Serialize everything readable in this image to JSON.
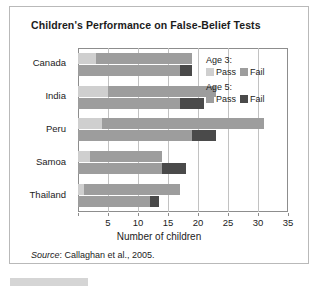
{
  "figure": {
    "title": "Children's Performance on False-Belief Tests",
    "source_word": "Source",
    "source_rest": ": Callaghan et al., 2005."
  },
  "legend": {
    "groups": [
      {
        "heading": "Age 3:",
        "items": [
          {
            "label": "Pass",
            "color": "#cfcfcf"
          },
          {
            "label": "Fail",
            "color": "#9d9d9d"
          }
        ]
      },
      {
        "heading": "Age 5:",
        "items": [
          {
            "label": "Pass",
            "color": "#9d9d9d"
          },
          {
            "label": "Fail",
            "color": "#4a4a4a"
          }
        ]
      }
    ]
  },
  "colors": {
    "age3_pass": "#cfcfcf",
    "age3_fail": "#9d9d9d",
    "age5_pass": "#9d9d9d",
    "age5_fail": "#4a4a4a",
    "gridline": "#c2c2c2",
    "axis": "#8d8d8d",
    "border": "#b9b9b9",
    "text": "#1c1c1c"
  },
  "chart_data": {
    "type": "bar",
    "orientation": "horizontal",
    "grouped": true,
    "stacked": true,
    "title": "Children's Performance on False-Belief Tests",
    "xlabel": "Number of children",
    "ylabel": "",
    "xlim": [
      0,
      35
    ],
    "xticks": [
      0,
      5,
      10,
      15,
      20,
      25,
      30,
      35
    ],
    "xtick_labels": [
      "",
      "5",
      "10",
      "15",
      "20",
      "25",
      "30",
      "35"
    ],
    "grid": "vertical",
    "legend_position": "upper right (inside plot)",
    "categories": [
      "Canada",
      "India",
      "Peru",
      "Samoa",
      "Thailand"
    ],
    "series": [
      {
        "name": "Age 3: Pass",
        "color": "#cfcfcf",
        "values": [
          3,
          5,
          4,
          2,
          1
        ]
      },
      {
        "name": "Age 3: Fail",
        "color": "#9d9d9d",
        "values": [
          16,
          18,
          27,
          12,
          16
        ]
      },
      {
        "name": "Age 5: Pass",
        "color": "#9d9d9d",
        "values": [
          17,
          17,
          19,
          14,
          12
        ]
      },
      {
        "name": "Age 5: Fail",
        "color": "#4a4a4a",
        "values": [
          2,
          4,
          4,
          4,
          1.5
        ]
      }
    ],
    "totals": {
      "age3": [
        19,
        23,
        31,
        14,
        17
      ],
      "age5": [
        19,
        21,
        23,
        18,
        13.5
      ]
    }
  }
}
